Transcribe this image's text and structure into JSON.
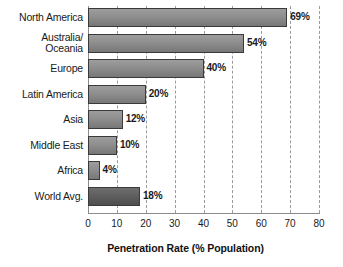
{
  "chart_data": {
    "type": "bar",
    "orientation": "horizontal",
    "title": "",
    "xlabel": "Penetration Rate (% Population)",
    "ylabel": "",
    "xlim": [
      0,
      80
    ],
    "xticks": [
      "0",
      "10",
      "20",
      "30",
      "40",
      "50",
      "60",
      "70",
      "80"
    ],
    "grid": "vertical-dashed",
    "legend": "none",
    "categories": [
      "North America",
      "Australia/\nOceania",
      "Europe",
      "Latin America",
      "Asia",
      "Middle East",
      "Africa",
      "World Avg."
    ],
    "values": [
      69,
      54,
      40,
      20,
      12,
      10,
      4,
      18
    ],
    "value_labels": [
      "69%",
      "54%",
      "40%",
      "20%",
      "12%",
      "10%",
      "4%",
      "18%"
    ],
    "emphasis_index": 7,
    "colors": {
      "bar_fill_top": "#9d9d9d",
      "bar_fill_bottom": "#777777",
      "bar_emphasis_top": "#6e6e6e",
      "bar_emphasis_bottom": "#4e4e4e",
      "bar_border": "#3a3a3a",
      "gridline": "#9a9a9a",
      "axis": "#8c8c8c",
      "text": "#1a1a1a",
      "background": "#ffffff"
    }
  }
}
